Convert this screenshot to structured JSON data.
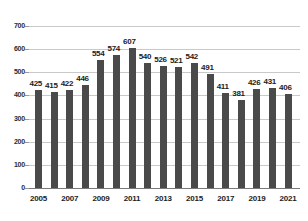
{
  "chart_data": {
    "type": "bar",
    "title": "",
    "subtitle": "",
    "xlabel": "",
    "ylabel": "",
    "grid": true,
    "legend": "none",
    "ylim": [
      0,
      700
    ],
    "y_ticks": [
      0,
      100,
      200,
      300,
      400,
      500,
      600,
      700
    ],
    "categories": [
      "2005",
      "2006",
      "2007",
      "2008",
      "2009",
      "2010",
      "2011",
      "2012",
      "2013",
      "2014",
      "2015",
      "2016",
      "2017",
      "2018",
      "2019",
      "2020",
      "2021"
    ],
    "x_tick_labels": [
      "2005",
      "2007",
      "2009",
      "2011",
      "2013",
      "2015",
      "2017",
      "2019",
      "2021"
    ],
    "values": [
      425,
      415,
      422,
      446,
      554,
      574,
      607,
      540,
      526,
      521,
      542,
      491,
      411,
      381,
      426,
      431,
      406
    ],
    "data_labels": [
      "425",
      "415",
      "422",
      "446",
      "554",
      "574",
      "607",
      "540",
      "526",
      "521",
      "542",
      "491",
      "411",
      "381",
      "426",
      "431",
      "406"
    ],
    "colors": {
      "bar": "#4a4a4a",
      "gridline": "#c9c9c9",
      "axis": "#7a7a7a",
      "text": "#1c1c1c",
      "background": "#ffffff"
    }
  }
}
